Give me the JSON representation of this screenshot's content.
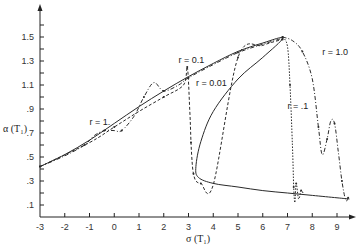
{
  "chart_data": {
    "type": "line",
    "title": "",
    "xlabel": "σ (T₁)",
    "ylabel": "α (T₁)",
    "xlim": [
      -3,
      9.7
    ],
    "ylim": [
      0,
      1.7
    ],
    "grid": false,
    "legend": "none (inline curve annotations)",
    "x_ticks": [
      "-3",
      "-2",
      "-1",
      "0",
      "1",
      "2",
      "3",
      "4",
      "5",
      "6",
      "7",
      "8",
      "9"
    ],
    "y_ticks": [
      ".1",
      ".3",
      ".5",
      ".7",
      ".9",
      "1.1",
      "1.3",
      "1.5"
    ],
    "annotations": [
      {
        "text": "r = 1.",
        "x": -1.0,
        "y": 0.77
      },
      {
        "text": "r = 0.1",
        "x": 2.6,
        "y": 1.28
      },
      {
        "text": "r = 0.01",
        "x": 3.3,
        "y": 1.09
      },
      {
        "text": "r = .1",
        "x": 7.0,
        "y": 0.9
      },
      {
        "text": "r = 1.0",
        "x": 8.4,
        "y": 1.35
      }
    ],
    "series": [
      {
        "name": "steady-state response (solid)",
        "style": "solid",
        "x": [
          -3,
          -2,
          -1,
          0,
          1,
          2,
          3,
          4,
          5,
          6,
          6.8,
          6.0,
          5.0,
          4.0,
          3.5,
          3.3,
          3.4,
          4.0,
          5.0,
          6.0,
          7.0,
          8.0,
          9.0,
          9.5
        ],
        "y": [
          0.42,
          0.52,
          0.64,
          0.78,
          0.92,
          1.05,
          1.17,
          1.28,
          1.38,
          1.45,
          1.49,
          1.33,
          1.15,
          0.88,
          0.63,
          0.42,
          0.33,
          0.28,
          0.25,
          0.22,
          0.2,
          0.18,
          0.16,
          0.15
        ]
      },
      {
        "name": "r = 1.",
        "style": "dash-dot",
        "x": [
          -3,
          -2,
          -1.2,
          -0.8,
          -0.4,
          0,
          0.3,
          0.8,
          1.2,
          1.6,
          2.0,
          2.6,
          3.0,
          4.0,
          5.0,
          6.0,
          6.8
        ],
        "y": [
          0.42,
          0.51,
          0.6,
          0.68,
          0.72,
          0.72,
          0.72,
          0.84,
          1.0,
          1.12,
          1.05,
          1.1,
          1.16,
          1.27,
          1.37,
          1.44,
          1.49
        ]
      },
      {
        "name": "r = 0.1 / r = 0.01",
        "style": "dashed with dots",
        "x": [
          -3,
          -1,
          0,
          1,
          2,
          2.8,
          2.95,
          3.05,
          3.1,
          3.15,
          3.2,
          3.3,
          3.5,
          4,
          5,
          6,
          6.8
        ],
        "y": [
          0.42,
          0.62,
          0.75,
          0.88,
          1.0,
          1.1,
          1.25,
          0.9,
          0.62,
          0.45,
          0.36,
          0.3,
          0.28,
          0.27,
          1.33,
          1.43,
          1.48
        ]
      },
      {
        "name": "r = .1",
        "style": "dotted",
        "x": [
          6.8,
          7.0,
          7.1,
          7.2,
          7.25,
          7.3,
          7.35,
          7.45,
          7.55,
          7.65
        ],
        "y": [
          1.5,
          1.42,
          1.1,
          0.6,
          0.25,
          0.12,
          0.28,
          0.15,
          0.22,
          0.19
        ]
      },
      {
        "name": "r = 1.0",
        "style": "dash-dot",
        "x": [
          6.8,
          7.2,
          7.6,
          8.0,
          8.25,
          8.4,
          8.6,
          8.75,
          8.9,
          9.05,
          9.2,
          9.35,
          9.45
        ],
        "y": [
          1.5,
          1.47,
          1.38,
          1.15,
          0.75,
          0.52,
          0.65,
          0.8,
          0.78,
          0.55,
          0.3,
          0.14,
          0.16
        ]
      }
    ]
  }
}
